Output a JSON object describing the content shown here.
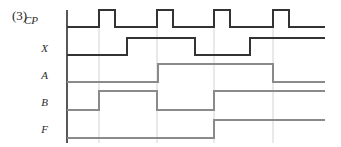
{
  "figure": {
    "number_label": "(3)",
    "type": "digital-timing-diagram",
    "width": 341,
    "height": 147,
    "background_color": "#ffffff",
    "axis_color": "#3a3a3a",
    "gridline_color": "#c8c8c8"
  },
  "axis": {
    "x": 67,
    "y_top": 10,
    "y_bottom": 143,
    "x_end": 325
  },
  "signals": [
    {
      "name": "CP",
      "label": "CP",
      "label_x": 38,
      "label_y": 22,
      "baseline_y": 27,
      "high_y": 10,
      "stroke": "#333333",
      "stroke_width": 1.6,
      "start_level": 0,
      "transitions": [
        {
          "x": 99,
          "level": 1
        },
        {
          "x": 115,
          "level": 0
        },
        {
          "x": 157,
          "level": 1
        },
        {
          "x": 173,
          "level": 0
        },
        {
          "x": 214,
          "level": 1
        },
        {
          "x": 230,
          "level": 0
        },
        {
          "x": 273,
          "level": 1
        },
        {
          "x": 289,
          "level": 0
        }
      ]
    },
    {
      "name": "X",
      "label": "X",
      "label_x": 48,
      "label_y": 50,
      "baseline_y": 55,
      "high_y": 38,
      "stroke": "#333333",
      "stroke_width": 1.6,
      "start_level": 0,
      "transitions": [
        {
          "x": 127,
          "level": 1
        },
        {
          "x": 195,
          "level": 0
        },
        {
          "x": 250,
          "level": 1
        }
      ]
    },
    {
      "name": "A",
      "label": "A",
      "label_x": 48,
      "label_y": 77,
      "baseline_y": 82,
      "high_y": 64,
      "stroke": "#8a8a8a",
      "stroke_width": 1.1,
      "start_level": 0,
      "transitions": [
        {
          "x": 158,
          "level": 1
        },
        {
          "x": 273,
          "level": 0
        }
      ]
    },
    {
      "name": "B",
      "label": "B",
      "label_x": 48,
      "label_y": 104,
      "baseline_y": 110,
      "high_y": 91,
      "stroke": "#8a8a8a",
      "stroke_width": 1.1,
      "start_level": 0,
      "transitions": [
        {
          "x": 99,
          "level": 1
        },
        {
          "x": 157,
          "level": 0
        },
        {
          "x": 214,
          "level": 1
        }
      ]
    },
    {
      "name": "F",
      "label": "F",
      "label_x": 48,
      "label_y": 131,
      "baseline_y": 138,
      "high_y": 120,
      "stroke": "#8a8a8a",
      "stroke_width": 1.1,
      "start_level": 0,
      "transitions": [
        {
          "x": 214,
          "level": 1
        }
      ]
    }
  ],
  "gridlines": [
    {
      "x": 99
    },
    {
      "x": 157
    },
    {
      "x": 214
    },
    {
      "x": 273
    }
  ]
}
